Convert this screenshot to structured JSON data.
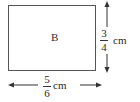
{
  "diagram": {
    "shape": "rectangle",
    "label": "B",
    "height_dim": {
      "numerator": "3",
      "denominator": "4",
      "unit": "cm"
    },
    "width_dim": {
      "numerator": "5",
      "denominator": "6",
      "unit": "cm"
    },
    "colors": {
      "stroke": "#555555",
      "text": "#2a2a2a",
      "background": "#ffffff"
    }
  }
}
